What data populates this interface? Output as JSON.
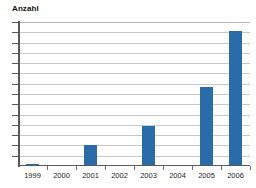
{
  "chart_data": {
    "type": "bar",
    "title": "Anzahl",
    "xlabel": "",
    "ylabel": "Anzahl",
    "categories": [
      "1999",
      "2000",
      "2001",
      "2002",
      "2003",
      "2004",
      "2005",
      "2006"
    ],
    "values": [
      0.2,
      0,
      2.1,
      0,
      4.0,
      0,
      8.0,
      13.6
    ],
    "series": [
      {
        "name": "Anzahl",
        "values": [
          0.2,
          0,
          2.1,
          0,
          4.0,
          0,
          8.0,
          13.6
        ],
        "color": "#2a6caa"
      }
    ],
    "ylim": [
      0,
      14.5
    ],
    "y_tick_count": 14,
    "y_tick_labels": [],
    "grid": true,
    "grid_color": "#c8c8c8",
    "legend": false,
    "legend_position": "none",
    "axis_color": "#585858",
    "background": "#ffffff"
  },
  "title": {
    "text": "Anzahl"
  },
  "axis": {
    "x_labels": [
      "1999",
      "2000",
      "2001",
      "2002",
      "2003",
      "2004",
      "2005",
      "2006"
    ]
  },
  "colors": {
    "bar": "#2a6caa",
    "grid": "#c8c8c8",
    "axis": "#585858",
    "text": "#1c1c1c",
    "background": "#ffffff"
  }
}
